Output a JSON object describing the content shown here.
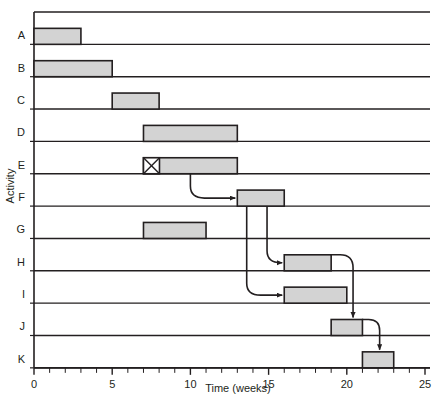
{
  "chart_data": {
    "type": "bar",
    "chart_kind": "gantt",
    "title": "",
    "xlabel": "Time (weeks)",
    "ylabel": "Activity",
    "xlim": [
      0,
      25
    ],
    "xticks": [
      0,
      5,
      10,
      15,
      20,
      25
    ],
    "xtick_labels": [
      "0",
      "5",
      "10",
      "15",
      "20",
      "25"
    ],
    "minor_tick_step": 1,
    "grid": false,
    "legend": null,
    "categories": [
      "A",
      "B",
      "C",
      "D",
      "E",
      "F",
      "G",
      "H",
      "I",
      "J",
      "K"
    ],
    "tasks": [
      {
        "activity": "A",
        "start": 0,
        "end": 3,
        "duration": 3,
        "marker": null
      },
      {
        "activity": "B",
        "start": 0,
        "end": 5,
        "duration": 5,
        "marker": null
      },
      {
        "activity": "C",
        "start": 5,
        "end": 8,
        "duration": 3,
        "marker": null
      },
      {
        "activity": "D",
        "start": 7,
        "end": 13,
        "duration": 6,
        "marker": null
      },
      {
        "activity": "E",
        "start": 7,
        "end": 13,
        "duration": 6,
        "marker": "crossed-box"
      },
      {
        "activity": "F",
        "start": 13,
        "end": 16,
        "duration": 3,
        "marker": null
      },
      {
        "activity": "G",
        "start": 7,
        "end": 11,
        "duration": 4,
        "marker": null
      },
      {
        "activity": "H",
        "start": 16,
        "end": 19,
        "duration": 3,
        "marker": null
      },
      {
        "activity": "I",
        "start": 16,
        "end": 20,
        "duration": 4,
        "marker": null
      },
      {
        "activity": "J",
        "start": 19,
        "end": 21,
        "duration": 2,
        "marker": null
      },
      {
        "activity": "K",
        "start": 21,
        "end": 23,
        "duration": 2,
        "marker": null
      }
    ],
    "dependencies": [
      {
        "from": "E",
        "to": "F",
        "from_week": 10,
        "to_week": 13
      },
      {
        "from": "F",
        "to": "H",
        "from_week": 13.6,
        "to_week": 16
      },
      {
        "from": "F",
        "to": "I",
        "from_week": 14.9,
        "to_week": 16
      },
      {
        "from": "H",
        "to": "J",
        "from_week": 20.4,
        "to_week": 20.4
      },
      {
        "from": "J",
        "to": "K",
        "from_week": 22.1,
        "to_week": 22.1
      }
    ],
    "bar_fill": "#d3d3d3",
    "bar_stroke": "#231f20",
    "axis_color": "#231f20",
    "row_line_color": "#231f20",
    "arrow_color": "#231f20"
  },
  "axes": {
    "x_axis_title": "Time (weeks)",
    "y_axis_title": "Activity"
  }
}
